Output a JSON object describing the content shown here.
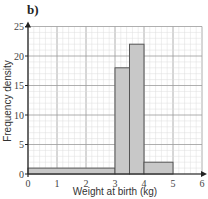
{
  "panel_label": "b)",
  "chart_data": {
    "type": "bar",
    "subtype": "histogram",
    "title": "",
    "xlabel": "Weight at birth (kg)",
    "ylabel": "Frequency density",
    "xlim": [
      0,
      6
    ],
    "ylim": [
      0,
      25
    ],
    "x_ticks": [
      "0",
      "1",
      "2",
      "3",
      "4",
      "5",
      "6"
    ],
    "y_ticks": [
      "0",
      "5",
      "10",
      "15",
      "20",
      "25"
    ],
    "grid": true,
    "bins": [
      {
        "from": 0,
        "to": 3,
        "value": 1
      },
      {
        "from": 3,
        "to": 3.5,
        "value": 18
      },
      {
        "from": 3.5,
        "to": 4,
        "value": 22
      },
      {
        "from": 4,
        "to": 5,
        "value": 2
      }
    ],
    "bar_color": "#c8c8c8",
    "bar_edge_color": "#555555"
  }
}
